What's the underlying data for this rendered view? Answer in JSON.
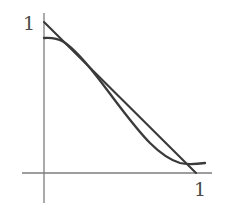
{
  "figure": {
    "width": 228,
    "height": 213,
    "background_color": "#ffffff"
  },
  "axes": {
    "color": "#7d7d7d",
    "line_width": 1.3,
    "origin": {
      "x": 44,
      "y": 173
    },
    "y_axis": {
      "x": 44,
      "y_top": 13,
      "y_bottom": 203
    },
    "x_axis": {
      "y": 173,
      "x_left": 22,
      "x_right": 212
    },
    "y_tick_label": "1",
    "x_tick_label": "1"
  },
  "chart_data": {
    "type": "line",
    "title": "",
    "subtitle": "",
    "xlabel": "",
    "ylabel": "",
    "xlim": [
      0,
      1.1
    ],
    "ylim": [
      0,
      1.1
    ],
    "xticks": [
      1
    ],
    "xticklabels": [
      "1"
    ],
    "yticks": [
      1
    ],
    "yticklabels": [
      "1"
    ],
    "grid": false,
    "legend": false,
    "legend_position": "none",
    "annotations": [],
    "series": [
      {
        "name": "straight-line",
        "description": "Straight chord from (0,1) to (1,0)",
        "color": "#3a3a3a",
        "line_width": 2.1,
        "x": [
          0.0,
          0.25,
          0.5,
          0.75,
          1.0
        ],
        "y": [
          1.0,
          0.75,
          0.5,
          0.25,
          0.0
        ],
        "pixel_path": "M 44 22 L 196 173"
      },
      {
        "name": "sigmoid-curve",
        "description": "S-shaped curve starting flat near y=0.9, crossing the chord, bulging below, then flattening near y=0.07",
        "color": "#3a3a3a",
        "line_width": 2.3,
        "x": [
          0.0,
          0.08,
          0.16,
          0.25,
          0.35,
          0.45,
          0.55,
          0.65,
          0.75,
          0.85,
          0.95,
          1.06
        ],
        "y": [
          0.895,
          0.888,
          0.855,
          0.79,
          0.7,
          0.59,
          0.475,
          0.365,
          0.262,
          0.17,
          0.1,
          0.068
        ],
        "pixel_path": "M 44 38 C 52 37.4 58 38.6 63 41.6 C 72 47 80 56 90 68 C 100 80 110 94 120 107 C 130 120 140 133 150 143 C 160 153 170 160 180 163 C 188 165 197 164 205 163"
      }
    ]
  }
}
